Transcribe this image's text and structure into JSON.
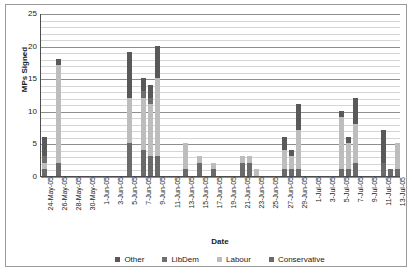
{
  "chart_data": {
    "type": "bar",
    "subtype": "stacked-vertical",
    "title": "",
    "xlabel": "Date",
    "ylabel": "MPs Signed",
    "ylim": [
      0,
      25
    ],
    "y_major_ticks": [
      0,
      5,
      10,
      15,
      20,
      25
    ],
    "y_minor_step": 1,
    "grid": "horizontal",
    "legend_position": "bottom",
    "stack_order_bottom_to_top": [
      "Conservative",
      "Labour",
      "LibDem",
      "Other"
    ],
    "categories": [
      "24-May-05",
      "25-May-05",
      "26-May-05",
      "27-May-05",
      "28-May-05",
      "29-May-05",
      "30-May-05",
      "31-May-05",
      "1-Jun-05",
      "2-Jun-05",
      "3-Jun-05",
      "4-Jun-05",
      "5-Jun-05",
      "6-Jun-05",
      "7-Jun-05",
      "8-Jun-05",
      "9-Jun-05",
      "10-Jun-05",
      "11-Jun-05",
      "12-Jun-05",
      "13-Jun-05",
      "14-Jun-05",
      "15-Jun-05",
      "16-Jun-05",
      "17-Jun-05",
      "18-Jun-05",
      "19-Jun-05",
      "20-Jun-05",
      "21-Jun-05",
      "22-Jun-05",
      "23-Jun-05",
      "24-Jun-05",
      "25-Jun-05",
      "26-Jun-05",
      "27-Jun-05",
      "28-Jun-05",
      "29-Jun-05",
      "30-Jun-05",
      "1-Jul-05",
      "2-Jul-05",
      "3-Jul-05",
      "4-Jul-05",
      "5-Jul-05",
      "6-Jul-05",
      "7-Jul-05",
      "8-Jul-05",
      "9-Jul-05",
      "10-Jul-05",
      "11-Jul-05",
      "12-Jul-05",
      "13-Jul-05"
    ],
    "x_tick_labels": [
      "24-May-05",
      "26-May-05",
      "28-May-05",
      "30-May-05",
      "1-Jun-05",
      "3-Jun-05",
      "5-Jun-05",
      "7-Jun-05",
      "9-Jun-05",
      "11-Jun-05",
      "13-Jun-05",
      "15-Jun-05",
      "17-Jun-05",
      "19-Jun-05",
      "21-Jun-05",
      "23-Jun-05",
      "25-Jun-05",
      "27-Jun-05",
      "29-Jun-05",
      "1-Jul-05",
      "3-Jul-05",
      "5-Jul-05",
      "7-Jul-05",
      "9-Jul-05",
      "11-Jul-05",
      "13-Jul-05"
    ],
    "series": [
      {
        "name": "Other",
        "color": "#595959",
        "values": [
          3,
          0,
          1,
          0,
          0,
          0,
          0,
          0,
          0,
          0,
          0,
          0,
          7,
          0,
          2,
          2,
          5,
          0,
          0,
          0,
          0,
          0,
          0,
          0,
          0,
          0,
          0,
          0,
          0,
          0,
          0,
          0,
          0,
          0,
          2,
          1,
          4,
          0,
          0,
          0,
          0,
          0,
          1,
          1,
          4,
          0,
          0,
          0,
          5,
          0,
          0
        ]
      },
      {
        "name": "LibDem",
        "color": "#6f6f6f",
        "values": [
          1,
          0,
          0,
          0,
          0,
          0,
          0,
          0,
          0,
          0,
          0,
          0,
          0,
          0,
          1,
          1,
          0,
          0,
          0,
          0,
          0,
          0,
          0,
          0,
          0,
          0,
          0,
          0,
          0,
          0,
          0,
          0,
          0,
          0,
          0,
          0,
          0,
          0,
          0,
          0,
          0,
          0,
          0,
          0,
          0,
          0,
          0,
          0,
          0,
          0,
          0
        ]
      },
      {
        "name": "Labour",
        "color": "#bdbdbd",
        "values": [
          1,
          0,
          15,
          0,
          0,
          0,
          0,
          0,
          0,
          0,
          0,
          0,
          7,
          0,
          8,
          8,
          12,
          0,
          0,
          0,
          4,
          0,
          1,
          0,
          1,
          0,
          0,
          0,
          1,
          1,
          1,
          0,
          0,
          0,
          3,
          2,
          6,
          0,
          0,
          0,
          0,
          0,
          8,
          4,
          6,
          0,
          0,
          0,
          0,
          0,
          4
        ]
      },
      {
        "name": "Conservative",
        "color": "#6a6a6a",
        "values": [
          1,
          0,
          2,
          0,
          0,
          0,
          0,
          0,
          0,
          0,
          0,
          0,
          5,
          0,
          4,
          3,
          3,
          0,
          0,
          0,
          1,
          0,
          2,
          0,
          1,
          0,
          0,
          0,
          2,
          2,
          0,
          0,
          0,
          0,
          1,
          1,
          1,
          0,
          0,
          0,
          0,
          0,
          1,
          1,
          2,
          0,
          0,
          0,
          2,
          1,
          1
        ]
      }
    ],
    "totals": [
      6,
      0,
      18,
      0,
      0,
      0,
      0,
      0,
      0,
      0,
      0,
      0,
      19,
      0,
      13,
      14,
      20,
      0,
      0,
      0,
      5,
      0,
      4,
      0,
      2,
      0,
      0,
      0,
      3,
      3,
      1,
      0,
      0,
      0,
      6,
      4,
      11,
      0,
      0,
      0,
      0,
      0,
      10,
      6,
      12,
      0,
      0,
      0,
      7,
      1,
      5
    ]
  },
  "legend": [
    {
      "label": "Other",
      "color": "#595959"
    },
    {
      "label": "LibDem",
      "color": "#6f6f6f"
    },
    {
      "label": "Labour",
      "color": "#bdbdbd"
    },
    {
      "label": "Conservative",
      "color": "#6a6a6a"
    }
  ],
  "axes": {
    "y_title": "MPs Signed",
    "x_title": "Date"
  },
  "colors": {
    "plot_background": "#ffffff",
    "frame_border": "#9a9a9a",
    "axis_line": "#4d4d4d",
    "gridline_minor": "#d5d5d5",
    "gridline_major": "#8e8e8e",
    "text": "#1a1a1a"
  }
}
